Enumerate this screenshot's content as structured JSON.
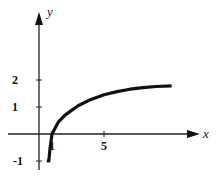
{
  "chart_data": {
    "type": "line",
    "title": "",
    "xlabel": "x",
    "ylabel": "y",
    "x_ticks": [
      {
        "value": 1,
        "label": "1"
      },
      {
        "value": 5,
        "label": "5"
      }
    ],
    "y_ticks": [
      {
        "value": -1,
        "label": "-1"
      },
      {
        "value": 1,
        "label": "1"
      },
      {
        "value": 2,
        "label": "2"
      }
    ],
    "xlim": [
      -3,
      13.5
    ],
    "ylim": [
      -1.4,
      4.8
    ],
    "grid": false,
    "legend": null,
    "series": [
      {
        "name": "curve",
        "color": "#111111",
        "x": [
          0.6,
          0.75,
          0.85,
          1.0,
          1.5,
          2.0,
          3.0,
          4.0,
          5.0,
          6.0,
          7.0,
          8.0,
          9.0,
          10.2
        ],
        "y": [
          -1.0,
          -1.0,
          -0.55,
          0.0,
          0.45,
          0.7,
          1.05,
          1.28,
          1.45,
          1.57,
          1.66,
          1.72,
          1.76,
          1.78
        ]
      }
    ]
  }
}
